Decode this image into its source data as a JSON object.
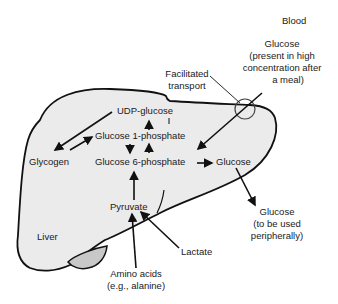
{
  "diagram": {
    "type": "metabolic-pathway",
    "colors": {
      "liver_fill": "#ebebeb",
      "gallbladder_fill": "#c8c8c8",
      "outline": "#111111",
      "text": "#1a1a1a",
      "background": "#ffffff"
    },
    "regions": {
      "blood": "Blood",
      "liver": "Liver"
    },
    "nodes": {
      "udp_glucose": "UDP-glucose",
      "glucose_1_phosphate": "Glucose 1-phosphate",
      "glucose_6_phosphate": "Glucose 6-phosphate",
      "glycogen": "Glycogen",
      "glucose_internal": "Glucose",
      "pyruvate": "Pyruvate",
      "lactate": "Lactate",
      "amino_acids_line1": "Amino acids",
      "amino_acids_line2": "(e.g., alanine)",
      "facilitated_line1": "Facilitated",
      "facilitated_line2": "transport",
      "blood_glucose_line1": "Glucose",
      "blood_glucose_line2": "(present in high",
      "blood_glucose_line3": "concentration after",
      "blood_glucose_line4": "a meal)",
      "peripheral_glucose_line1": "Glucose",
      "peripheral_glucose_line2": "(to be used",
      "peripheral_glucose_line3": "peripherally)"
    },
    "edges": [
      {
        "from": "UDP-glucose",
        "to": "Glycogen"
      },
      {
        "from": "Glycogen",
        "to": "Glucose 1-phosphate"
      },
      {
        "from": "Glucose 1-phosphate",
        "to": "UDP-glucose"
      },
      {
        "from": "Glucose 1-phosphate",
        "to": "Glucose 6-phosphate"
      },
      {
        "from": "Glucose 6-phosphate",
        "to": "Glucose 1-phosphate"
      },
      {
        "from": "Blood glucose",
        "to": "Glucose 6-phosphate"
      },
      {
        "from": "Glucose 6-phosphate",
        "to": "Glucose"
      },
      {
        "from": "Glucose",
        "to": "Glucose (peripheral)"
      },
      {
        "from": "Pyruvate",
        "to": "Glucose 6-phosphate"
      },
      {
        "from": "Lactate",
        "to": "Pyruvate"
      },
      {
        "from": "Amino acids",
        "to": "Pyruvate"
      }
    ]
  }
}
